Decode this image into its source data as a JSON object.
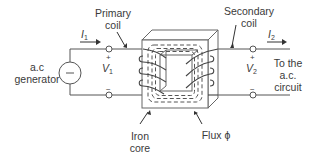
{
  "diagram": {
    "labels": {
      "primary_coil": [
        "Primary",
        "coil"
      ],
      "secondary_coil": [
        "Secondary",
        "coil"
      ],
      "generator": [
        "a.c",
        "generator"
      ],
      "load": [
        "To the",
        "a.c.",
        "circuit"
      ],
      "iron_core": [
        "Iron",
        "core"
      ],
      "flux": "Flux ϕ"
    },
    "currents": {
      "primary": {
        "symbol": "I",
        "sub": "1"
      },
      "secondary": {
        "symbol": "I",
        "sub": "2"
      }
    },
    "voltages": {
      "primary": {
        "symbol": "V",
        "sub": "1",
        "plus": "+",
        "minus": "−"
      },
      "secondary": {
        "symbol": "V",
        "sub": "2",
        "plus": "+",
        "minus": "−"
      }
    },
    "generator_symbol": "−",
    "colors": {
      "line": "#555555",
      "core_fill": "#ffffff",
      "core_edge": "#666666"
    }
  }
}
